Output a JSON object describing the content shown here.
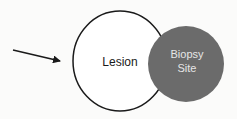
{
  "diagram": {
    "labels": {
      "lesion": "Lesion",
      "biopsy_line1": "Biopsy",
      "biopsy_line2": "Site"
    },
    "colors": {
      "background": "#fbfbfa",
      "outline": "#1a1a1a",
      "biopsy_fill": "#6b6b6b",
      "biopsy_text": "#e6e6e6"
    },
    "elements": [
      {
        "type": "arrow",
        "from": [
          13,
          50
        ],
        "to": [
          60,
          61
        ]
      },
      {
        "type": "ellipse",
        "name": "lesion",
        "cx": 120,
        "cy": 61,
        "rx": 47,
        "ry": 50
      },
      {
        "type": "circle",
        "name": "biopsy-site",
        "cx": 186,
        "cy": 64,
        "r": 38
      }
    ]
  }
}
